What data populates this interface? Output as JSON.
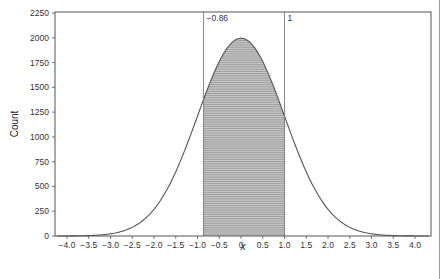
{
  "chart_data": {
    "type": "area",
    "title": "",
    "xlabel": "x",
    "ylabel": "Count",
    "xlim": [
      -4.25,
      4.4
    ],
    "ylim": [
      0,
      2250
    ],
    "x_ticks": [
      -4.0,
      -3.5,
      -3.0,
      -2.5,
      -2.0,
      -1.5,
      -1.0,
      -0.5,
      0,
      0.5,
      1.0,
      1.5,
      2.0,
      2.5,
      3.0,
      3.5,
      4.0
    ],
    "x_tick_labels": [
      "−4.0",
      "−3.5",
      "−3.0",
      "−2.5",
      "−2.0",
      "−1.5",
      "−1.0",
      "−0.5",
      "0",
      "0.5",
      "1.0",
      "1.5",
      "2.0",
      "2.5",
      "3.0",
      "3.5",
      "4.0"
    ],
    "y_ticks": [
      0,
      250,
      500,
      750,
      1000,
      1250,
      1500,
      1750,
      2000,
      2250
    ],
    "y_tick_labels": [
      "0",
      "250",
      "500",
      "750",
      "1000",
      "1250",
      "1500",
      "1750",
      "2000",
      "2250"
    ],
    "grid": false,
    "legend": null,
    "series": [
      {
        "name": "normal curve",
        "distribution": "normal",
        "mean": 0,
        "sd": 1,
        "peak": 1995,
        "x": [
          -4.0,
          -3.5,
          -3.0,
          -2.5,
          -2.0,
          -1.5,
          -1.0,
          -0.5,
          0,
          0.5,
          1.0,
          1.5,
          2.0,
          2.5,
          3.0,
          3.5,
          4.0
        ],
        "values": [
          1,
          4,
          22,
          88,
          270,
          648,
          1210,
          1761,
          1995,
          1761,
          1210,
          648,
          270,
          88,
          22,
          4,
          1
        ]
      }
    ],
    "shaded_region": {
      "from": -0.86,
      "to": 1,
      "pattern": "horizontal-hatch"
    },
    "annotations": [
      {
        "text": "−0.86",
        "x": -0.86,
        "type": "vertical-line"
      },
      {
        "text": "1",
        "x": 1,
        "type": "vertical-line"
      }
    ]
  },
  "layout": {
    "frame": {
      "left": 55,
      "right": 431,
      "top": 12,
      "bottom": 236
    },
    "x_origin_px": 241,
    "x_unit_px": 43.5,
    "y_zero_px": 236,
    "y_px_per_count": 0.0991
  },
  "colors": {
    "axis": "#555555",
    "curve": "#555555",
    "hatch": "#8a8a8a",
    "fill": "#c8c8c8",
    "vline": "#777777"
  }
}
